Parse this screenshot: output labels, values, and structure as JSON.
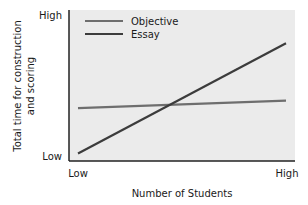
{
  "chart_data": {
    "type": "line",
    "title": "",
    "xlabel": "Number of Students",
    "ylabel": "Total time for construction and scoring",
    "ylabel_lines": [
      "Total time for construction",
      "and scoring"
    ],
    "x_tick_labels": [
      "Low",
      "High"
    ],
    "y_tick_labels": [
      "Low",
      "High"
    ],
    "xlim": [
      0,
      10
    ],
    "ylim": [
      0,
      10
    ],
    "grid": false,
    "legend_position": "upper-left inside plot",
    "x": [
      0,
      10
    ],
    "series": [
      {
        "name": "Objective",
        "values": [
          3.5,
          4.0
        ],
        "color": "#6e6e6e"
      },
      {
        "name": "Essay",
        "values": [
          0.5,
          7.8
        ],
        "color": "#3c3c3c"
      }
    ],
    "annotations": []
  },
  "style": {
    "plot_background": "#ebebeb",
    "axis_color": "#222222"
  }
}
